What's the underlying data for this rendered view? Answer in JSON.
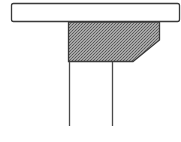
{
  "diagram": {
    "colors": {
      "background": "#ffffff",
      "outline": "#3a3a3a",
      "plank_fill": "#ffffff",
      "block_fill": "#8c8c8c"
    },
    "parts": [
      "top-plank",
      "shaded-block",
      "left-leg",
      "right-leg"
    ]
  }
}
